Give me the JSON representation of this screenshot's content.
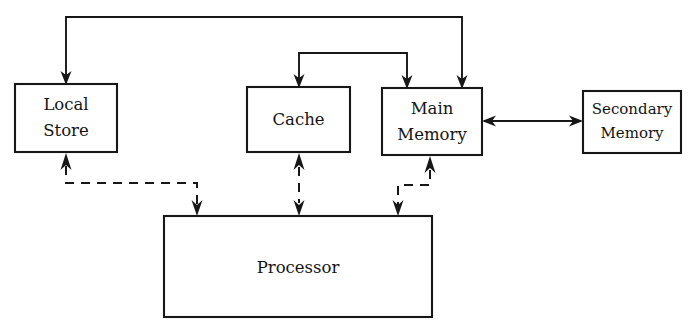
{
  "diagram": {
    "background_color": "#ffffff",
    "line_color": "#171717",
    "text_color": "#141414",
    "nodes": [
      {
        "id": "local-store",
        "label_line1": "Local",
        "label_line2": "Store",
        "x": 15,
        "y": 84,
        "w": 102,
        "h": 68
      },
      {
        "id": "cache",
        "label_line1": "Cache",
        "label_line2": "",
        "x": 247,
        "y": 87,
        "w": 103,
        "h": 65
      },
      {
        "id": "main-memory",
        "label_line1": "Main",
        "label_line2": "Memory",
        "x": 382,
        "y": 88,
        "w": 100,
        "h": 67
      },
      {
        "id": "secondary-memory",
        "label_line1": "Secondary",
        "label_line2": "Memory",
        "x": 583,
        "y": 91,
        "w": 98,
        "h": 62
      },
      {
        "id": "processor",
        "label_line1": "Processor",
        "label_line2": "",
        "x": 164,
        "y": 216,
        "w": 268,
        "h": 101
      }
    ],
    "edges": [
      {
        "id": "bus-to-local-store",
        "style": "solid",
        "from": "memory-bus",
        "to": "local-store",
        "arrow": "single"
      },
      {
        "id": "bus-to-main-memory",
        "style": "solid",
        "from": "memory-bus",
        "to": "main-memory",
        "arrow": "single"
      },
      {
        "id": "bus-to-cache",
        "style": "solid",
        "from": "inner-bus",
        "to": "cache",
        "arrow": "single"
      },
      {
        "id": "inner-bus-to-main-memory",
        "style": "solid",
        "from": "inner-bus",
        "to": "main-memory",
        "arrow": "single"
      },
      {
        "id": "main-memory-secondary-memory",
        "style": "solid",
        "from": "main-memory",
        "to": "secondary-memory",
        "arrow": "double"
      },
      {
        "id": "local-store-processor",
        "style": "dashed",
        "from": "local-store",
        "to": "processor",
        "arrow": "double"
      },
      {
        "id": "cache-processor",
        "style": "dashed",
        "from": "cache",
        "to": "processor",
        "arrow": "double"
      },
      {
        "id": "main-memory-processor",
        "style": "dashed",
        "from": "main-memory",
        "to": "processor",
        "arrow": "double"
      }
    ]
  }
}
